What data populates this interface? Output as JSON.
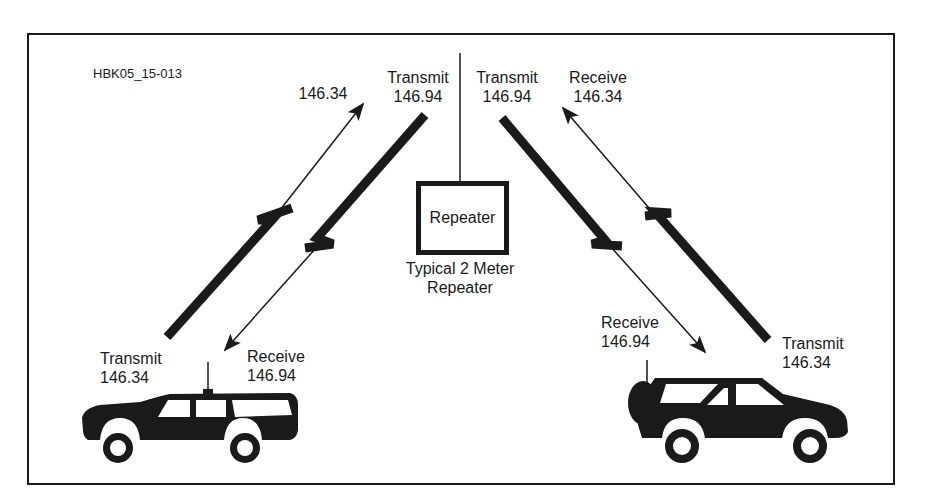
{
  "figure_id": "HBK05_15-013",
  "repeater": {
    "box_label": "Repeater",
    "caption_line1": "Typical 2 Meter",
    "caption_line2": "Repeater"
  },
  "links": {
    "repeater_tx_left": {
      "mode": "Transmit",
      "freq": "146.94"
    },
    "repeater_rx_left": {
      "mode": "",
      "freq": "146.34"
    },
    "repeater_tx_right": {
      "mode": "Transmit",
      "freq": "146.94"
    },
    "repeater_rx_right": {
      "mode": "Receive",
      "freq": "146.34"
    }
  },
  "stations": {
    "left_car": {
      "transmit": {
        "mode": "Transmit",
        "freq": "146.34"
      },
      "receive": {
        "mode": "Receive",
        "freq": "146.94"
      }
    },
    "right_car": {
      "transmit": {
        "mode": "Transmit",
        "freq": "146.34"
      },
      "receive": {
        "mode": "Receive",
        "freq": "146.94"
      }
    }
  },
  "colors": {
    "ink": "#1a1a1a",
    "background": "#ffffff"
  }
}
